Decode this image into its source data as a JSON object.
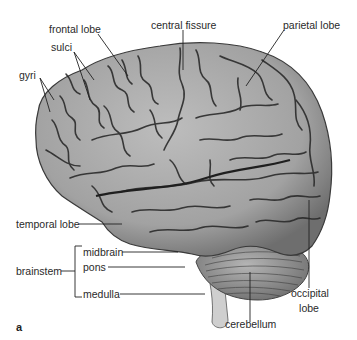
{
  "figure": {
    "panel_letter": "a"
  },
  "labels": {
    "frontal_lobe": "frontal lobe",
    "central_fissure": "central fissure",
    "parietal_lobe": "parietal lobe",
    "sulci": "sulci",
    "gyri": "gyri",
    "temporal_lobe": "temporal lobe",
    "brainstem": "brainstem",
    "midbrain": "midbrain",
    "pons": "pons",
    "medulla": "medulla",
    "occipital_line1": "occipital",
    "occipital_line2": "lobe",
    "cerebellum": "cerebellum"
  },
  "colors": {
    "brain_fill": "#a9a9a9",
    "brain_shade": "#8a8a8a",
    "sulcus_line": "#2b2b2b",
    "cerebellum_fill": "#9c9c9c",
    "leader_line": "#222222"
  }
}
